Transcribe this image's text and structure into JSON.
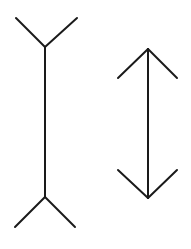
{
  "diagram": {
    "stroke_color": "#1a1a1a",
    "stroke_width": 2,
    "figures": [
      {
        "name": "fins-out-line",
        "shaft": {
          "x1": 45,
          "y1": 47,
          "x2": 45,
          "y2": 197
        },
        "fins": [
          {
            "x1": 45,
            "y1": 47,
            "x2": 16,
            "y2": 18
          },
          {
            "x1": 45,
            "y1": 47,
            "x2": 77,
            "y2": 18
          },
          {
            "x1": 45,
            "y1": 197,
            "x2": 15,
            "y2": 227
          },
          {
            "x1": 45,
            "y1": 197,
            "x2": 75,
            "y2": 227
          }
        ]
      },
      {
        "name": "fins-in-line",
        "shaft": {
          "x1": 148,
          "y1": 49,
          "x2": 148,
          "y2": 198
        },
        "fins": [
          {
            "x1": 148,
            "y1": 49,
            "x2": 118,
            "y2": 78
          },
          {
            "x1": 148,
            "y1": 49,
            "x2": 177,
            "y2": 78
          },
          {
            "x1": 148,
            "y1": 198,
            "x2": 118,
            "y2": 170
          },
          {
            "x1": 148,
            "y1": 198,
            "x2": 177,
            "y2": 170
          }
        ]
      }
    ]
  }
}
